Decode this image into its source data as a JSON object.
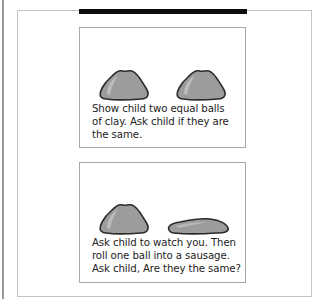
{
  "page": {
    "top_bar_color": "#0c0c0c",
    "clay_color": "#9c9c9c",
    "clay_outline": "#2a2a2a"
  },
  "cards": [
    {
      "illustrations": [
        "clay-ball",
        "clay-ball"
      ],
      "caption_lines": [
        "Show child two equal balls",
        "of clay. Ask child if they are",
        "the same."
      ]
    },
    {
      "illustrations": [
        "clay-ball",
        "clay-sausage"
      ],
      "caption_lines": [
        "Ask child to watch you. Then",
        "roll one ball into a sausage.",
        "Ask child,  Are they the same?"
      ]
    }
  ]
}
